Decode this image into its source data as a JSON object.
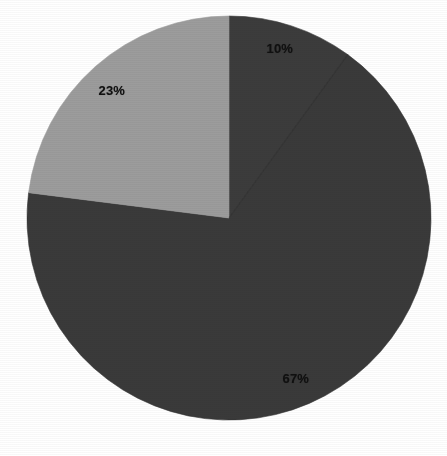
{
  "chart": {
    "type": "pie",
    "background_color": "#ffffff",
    "center": {
      "x": 229,
      "y": 218
    },
    "radius": 202
  },
  "chart_data": {
    "type": "pie",
    "title": "",
    "subtitle": "",
    "xlabel": "",
    "ylabel": "",
    "grid": false,
    "legend": false,
    "legend_position": "none",
    "units": "percent",
    "total": 100,
    "categories": [
      "10%",
      "67%",
      "23%"
    ],
    "values": [
      10,
      67,
      23
    ],
    "labels": [
      "10%",
      "67%",
      "23%"
    ],
    "colors": [
      "#3c3c3c",
      "#3a3a3a",
      "#9c9c9c"
    ],
    "start_angle_deg": 0,
    "direction": "clockwise",
    "slices": [
      {
        "label": "10%",
        "value": 10,
        "color": "#3c3c3c",
        "start_angle_deg": 0,
        "end_angle_deg": 36,
        "label_x": 280,
        "label_y": 48
      },
      {
        "label": "67%",
        "value": 67,
        "color": "#3a3a3a",
        "start_angle_deg": 36,
        "end_angle_deg": 277.2,
        "label_x": 296,
        "label_y": 378
      },
      {
        "label": "23%",
        "value": 23,
        "color": "#9c9c9c",
        "start_angle_deg": 277.2,
        "end_angle_deg": 360,
        "label_x": 112,
        "label_y": 90
      }
    ]
  }
}
